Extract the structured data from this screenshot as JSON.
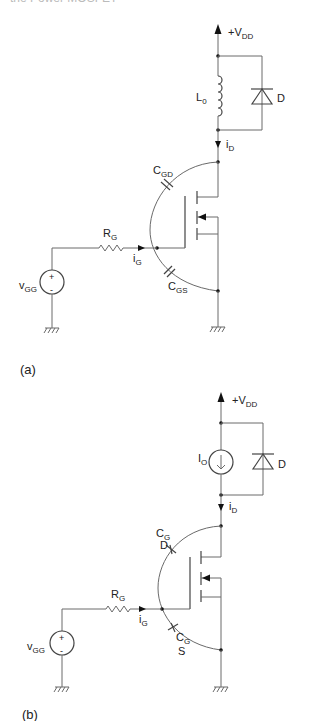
{
  "header_fragment": "the Power MOSFET",
  "figures": [
    {
      "caption": "(a)",
      "labels": {
        "supply": {
          "main": "+V",
          "sub": "DD"
        },
        "load": {
          "main": "L",
          "sub": "0"
        },
        "diode": "D",
        "drain_current": {
          "main": "i",
          "sub": "D"
        },
        "cap_gd": {
          "main": "C",
          "sub": "GD"
        },
        "cap_gs": {
          "main": "C",
          "sub": "GS"
        },
        "gate_resistor": {
          "main": "R",
          "sub": "G"
        },
        "gate_current": {
          "main": "i",
          "sub": "G"
        },
        "gate_source": {
          "main": "v",
          "sub": "GG"
        },
        "plus": "+",
        "minus": "-"
      }
    },
    {
      "caption": "(b)",
      "labels": {
        "supply": {
          "main": "+V",
          "sub": "DD"
        },
        "load": {
          "main": "I",
          "sub": "O"
        },
        "diode": "D",
        "drain_current": {
          "main": "i",
          "sub": "D"
        },
        "cap_gd": {
          "main": "C",
          "sub": "G",
          "line2": "D"
        },
        "cap_gs": {
          "main": "C",
          "sub": "G",
          "line2": "S"
        },
        "gate_resistor": {
          "main": "R",
          "sub": "G"
        },
        "gate_current": {
          "main": "i",
          "sub": "G"
        },
        "gate_source": {
          "main": "v",
          "sub": "GG"
        },
        "plus": "+",
        "minus": "-"
      }
    }
  ]
}
